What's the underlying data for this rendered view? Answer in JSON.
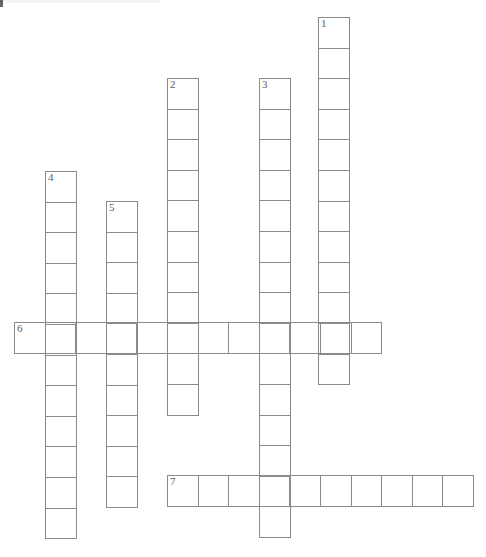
{
  "puzzle": {
    "title": "Crossword Puzzle Grid",
    "cell_size": 30.6,
    "grid_line_color": "#8a8a8a",
    "number_color": "#5c5c5c",
    "background_color": "#ffffff",
    "canvas": {
      "width": 486,
      "height": 557
    }
  },
  "entries": [
    {
      "number": "1",
      "direction": "down",
      "length": 12,
      "x": 318,
      "y": 17,
      "letters": [
        "",
        "",
        "",
        "",
        "",
        "",
        "",
        "",
        "",
        "",
        "",
        ""
      ]
    },
    {
      "number": "2",
      "direction": "down",
      "length": 11,
      "x": 167,
      "y": 78,
      "letters": [
        "",
        "",
        "",
        "",
        "",
        "",
        "",
        "",
        "",
        "",
        ""
      ]
    },
    {
      "number": "3",
      "direction": "down",
      "length": 15,
      "x": 259,
      "y": 78,
      "letters": [
        "",
        "",
        "",
        "",
        "",
        "",
        "",
        "",
        "",
        "",
        "",
        "",
        "",
        "",
        ""
      ]
    },
    {
      "number": "4",
      "direction": "down",
      "length": 12,
      "x": 45,
      "y": 171,
      "letters": [
        "",
        "",
        "",
        "",
        "",
        "",
        "",
        "",
        "",
        "",
        "",
        ""
      ]
    },
    {
      "number": "5",
      "direction": "down",
      "length": 10,
      "x": 106,
      "y": 201,
      "letters": [
        "",
        "",
        "",
        "",
        "",
        "",
        "",
        "",
        "",
        ""
      ]
    },
    {
      "number": "6",
      "direction": "across",
      "length": 12,
      "x": 14,
      "y": 322,
      "letters": [
        "",
        "",
        "",
        "",
        "",
        "",
        "",
        "",
        "",
        "",
        "",
        ""
      ]
    },
    {
      "number": "7",
      "direction": "across",
      "length": 10,
      "x": 167,
      "y": 475,
      "letters": [
        "",
        "",
        "",
        "",
        "",
        "",
        "",
        "",
        "",
        ""
      ]
    }
  ]
}
